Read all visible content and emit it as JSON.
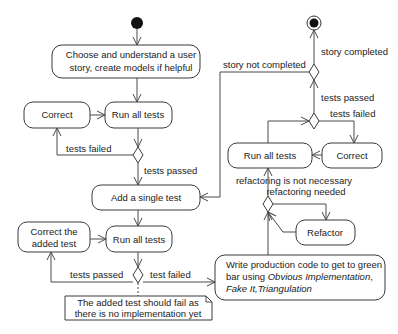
{
  "diagram": {
    "type": "uml-activity",
    "nodes": {
      "choose_story": {
        "lines": [
          "Choose and understand a user",
          "story, create models if helpful"
        ]
      },
      "correct_left": {
        "label": "Correct"
      },
      "run_tests_1": {
        "label": "Run all tests"
      },
      "add_test": {
        "label": "Add a single test"
      },
      "correct_added": {
        "lines": [
          "Correct the",
          "added test"
        ]
      },
      "run_tests_2": {
        "label": "Run all tests"
      },
      "write_code": {
        "line1": "Write production code to get to green",
        "line2_prefix": "bar using ",
        "line2_italic": "Obvious Implementation",
        "line2_suffix": ",",
        "line3_italic": "Fake It,Triangulation"
      },
      "refactor": {
        "label": "Refactor"
      },
      "run_tests_3": {
        "label": "Run all tests"
      },
      "correct_right": {
        "label": "Correct"
      }
    },
    "note": {
      "lines": [
        "The added test should fail as",
        "there is no implementation yet"
      ]
    },
    "edge_labels": {
      "tests_failed_1": "tests failed",
      "tests_passed_1": "tests passed",
      "tests_passed_2": "tests passed",
      "test_failed_2": "test failed",
      "refactoring_not_necessary": "refactoring is not necessary",
      "refactoring_needed": "refactoring needed",
      "tests_passed_3": "tests passed",
      "tests_failed_3": "tests failed",
      "story_completed": "story completed",
      "story_not_completed": "story not completed"
    }
  }
}
